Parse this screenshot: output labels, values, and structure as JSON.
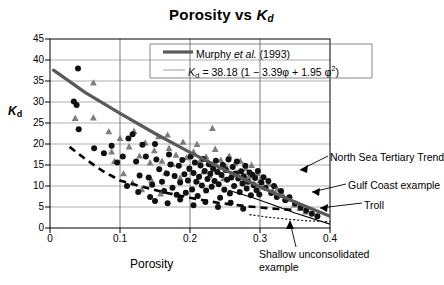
{
  "figure": {
    "title_main": "Porosity vs ",
    "title_var": "K",
    "title_var_sub": "d",
    "y_axis_label": "K",
    "y_axis_label_sub": "d",
    "x_axis_label": "Porosity"
  },
  "legend": {
    "entry_label_pre": "Murphy ",
    "entry_label_ital": "et al.",
    "entry_label_post": " (1993)",
    "equation_var": "K",
    "equation_var_sub": "d",
    "equation_body": " = 38.18 (1 − 3.39φ + 1.95 φ",
    "equation_exp": "2",
    "equation_close": ")",
    "line_color": "#595959"
  },
  "annotations": [
    {
      "name": "north-sea-tertiary-trend",
      "text": "North Sea Tertiary Trend"
    },
    {
      "name": "gulf-coast-example",
      "text": "Gulf Coast example"
    },
    {
      "name": "troll",
      "text": "Troll"
    },
    {
      "name": "shallow-unconsolidated-example-line1",
      "text": "Shallow unconsolidated"
    },
    {
      "name": "shallow-unconsolidated-example-line2",
      "text": "example"
    }
  ],
  "chart_data": {
    "type": "scatter",
    "title": "Porosity vs Kd",
    "xlabel": "Porosity",
    "ylabel": "Kd",
    "xlim": [
      0,
      0.4
    ],
    "ylim": [
      0,
      45
    ],
    "xticks": [
      "0",
      "0.1",
      "0.2",
      "0.3",
      "0.4"
    ],
    "xtick_values": [
      0,
      0.1,
      0.2,
      0.3,
      0.4
    ],
    "yticks": [
      "0",
      "5",
      "10",
      "15",
      "20",
      "25",
      "30",
      "35",
      "40",
      "45"
    ],
    "ytick_values": [
      0,
      5,
      10,
      15,
      20,
      25,
      30,
      35,
      40,
      45
    ],
    "grid": "both",
    "legend_position": "top-right-inside",
    "series": [
      {
        "name": "Murphy et al. (1993) fit",
        "type": "line",
        "style": "solid-thick",
        "color": "#595959",
        "equation": "Kd = 38.18 (1 - 3.39*phi + 1.95*phi^2)",
        "points": [
          [
            0.005,
            37.6
          ],
          [
            0.05,
            32.3
          ],
          [
            0.1,
            27.3
          ],
          [
            0.15,
            22.5
          ],
          [
            0.2,
            18.0
          ],
          [
            0.25,
            13.8
          ],
          [
            0.3,
            9.8
          ],
          [
            0.35,
            6.2
          ],
          [
            0.4,
            2.8
          ]
        ]
      },
      {
        "name": "North Sea Tertiary Trend",
        "type": "line",
        "style": "dashed",
        "color": "#000000",
        "points": [
          [
            0.028,
            19.3
          ],
          [
            0.05,
            16.5
          ],
          [
            0.075,
            13.6
          ],
          [
            0.1,
            11.3
          ],
          [
            0.13,
            9.9
          ],
          [
            0.16,
            8.6
          ],
          [
            0.2,
            7.2
          ],
          [
            0.24,
            6.0
          ],
          [
            0.28,
            5.2
          ],
          [
            0.32,
            4.6
          ],
          [
            0.345,
            4.3
          ]
        ]
      },
      {
        "name": "Shallow unconsolidated trend",
        "type": "line",
        "style": "dotted",
        "color": "#000000",
        "points": [
          [
            0.285,
            3.2
          ],
          [
            0.31,
            2.6
          ],
          [
            0.34,
            2.1
          ],
          [
            0.37,
            1.7
          ],
          [
            0.4,
            1.5
          ]
        ]
      },
      {
        "name": "Gulf Coast example (black circles)",
        "type": "scatter",
        "marker": "circle",
        "color": "#111111",
        "points": [
          [
            0.04,
            38.0
          ],
          [
            0.034,
            30.1
          ],
          [
            0.038,
            29.3
          ],
          [
            0.041,
            23.5
          ],
          [
            0.063,
            19.0
          ],
          [
            0.077,
            17.8
          ],
          [
            0.088,
            19.6
          ],
          [
            0.096,
            15.6
          ],
          [
            0.104,
            17.0
          ],
          [
            0.112,
            21.3
          ],
          [
            0.118,
            22.3
          ],
          [
            0.123,
            15.8
          ],
          [
            0.128,
            12.5
          ],
          [
            0.132,
            19.8
          ],
          [
            0.137,
            17.0
          ],
          [
            0.141,
            12.0
          ],
          [
            0.146,
            10.3
          ],
          [
            0.15,
            20.0
          ],
          [
            0.152,
            16.3
          ],
          [
            0.156,
            14.0
          ],
          [
            0.16,
            11.0
          ],
          [
            0.163,
            8.8
          ],
          [
            0.167,
            13.0
          ],
          [
            0.17,
            17.5
          ],
          [
            0.172,
            15.1
          ],
          [
            0.175,
            9.6
          ],
          [
            0.178,
            12.4
          ],
          [
            0.181,
            7.9
          ],
          [
            0.184,
            14.8
          ],
          [
            0.186,
            10.8
          ],
          [
            0.189,
            16.2
          ],
          [
            0.192,
            12.8
          ],
          [
            0.194,
            8.4
          ],
          [
            0.197,
            11.3
          ],
          [
            0.199,
            14.2
          ],
          [
            0.201,
            17.0
          ],
          [
            0.203,
            9.2
          ],
          [
            0.205,
            13.1
          ],
          [
            0.207,
            15.6
          ],
          [
            0.209,
            11.0
          ],
          [
            0.211,
            7.6
          ],
          [
            0.213,
            12.2
          ],
          [
            0.215,
            14.9
          ],
          [
            0.217,
            10.1
          ],
          [
            0.219,
            16.4
          ],
          [
            0.221,
            13.6
          ],
          [
            0.223,
            8.9
          ],
          [
            0.225,
            11.7
          ],
          [
            0.227,
            15.2
          ],
          [
            0.229,
            12.9
          ],
          [
            0.231,
            9.8
          ],
          [
            0.233,
            14.1
          ],
          [
            0.235,
            11.2
          ],
          [
            0.237,
            16.0
          ],
          [
            0.239,
            13.3
          ],
          [
            0.241,
            10.4
          ],
          [
            0.243,
            7.2
          ],
          [
            0.245,
            12.6
          ],
          [
            0.247,
            15.0
          ],
          [
            0.249,
            9.1
          ],
          [
            0.251,
            13.8
          ],
          [
            0.253,
            11.5
          ],
          [
            0.255,
            16.3
          ],
          [
            0.257,
            8.2
          ],
          [
            0.259,
            12.0
          ],
          [
            0.261,
            14.5
          ],
          [
            0.263,
            10.0
          ],
          [
            0.265,
            13.0
          ],
          [
            0.267,
            15.8
          ],
          [
            0.269,
            11.8
          ],
          [
            0.271,
            8.6
          ],
          [
            0.273,
            13.5
          ],
          [
            0.275,
            10.6
          ],
          [
            0.277,
            12.3
          ],
          [
            0.279,
            14.8
          ],
          [
            0.281,
            9.4
          ],
          [
            0.283,
            11.0
          ],
          [
            0.285,
            13.2
          ],
          [
            0.287,
            7.8
          ],
          [
            0.289,
            12.7
          ],
          [
            0.291,
            10.2
          ],
          [
            0.293,
            11.9
          ],
          [
            0.295,
            9.0
          ],
          [
            0.297,
            13.6
          ],
          [
            0.299,
            8.0
          ],
          [
            0.302,
            10.8
          ],
          [
            0.305,
            12.1
          ],
          [
            0.308,
            9.5
          ],
          [
            0.312,
            11.2
          ],
          [
            0.316,
            8.3
          ],
          [
            0.32,
            10.0
          ],
          [
            0.324,
            7.4
          ],
          [
            0.33,
            8.8
          ],
          [
            0.336,
            6.6
          ],
          [
            0.342,
            7.3
          ],
          [
            0.35,
            5.8
          ],
          [
            0.358,
            4.9
          ],
          [
            0.366,
            4.2
          ],
          [
            0.374,
            3.4
          ],
          [
            0.382,
            2.8
          ],
          [
            0.15,
            6.4
          ],
          [
            0.168,
            5.9
          ],
          [
            0.186,
            6.8
          ],
          [
            0.205,
            5.4
          ],
          [
            0.222,
            6.2
          ],
          [
            0.24,
            5.0
          ],
          [
            0.258,
            6.0
          ],
          [
            0.276,
            4.6
          ],
          [
            0.11,
            10.0
          ],
          [
            0.126,
            8.6
          ],
          [
            0.143,
            7.4
          ]
        ]
      },
      {
        "name": "North Sea samples (gray triangles)",
        "type": "scatter",
        "marker": "triangle",
        "color": "#7d7d7d",
        "points": [
          [
            0.062,
            34.6
          ],
          [
            0.036,
            26.2
          ],
          [
            0.062,
            26.3
          ],
          [
            0.084,
            23.0
          ],
          [
            0.1,
            21.4
          ],
          [
            0.113,
            19.4
          ],
          [
            0.12,
            23.1
          ],
          [
            0.128,
            17.2
          ],
          [
            0.136,
            20.3
          ],
          [
            0.143,
            15.6
          ],
          [
            0.149,
            18.5
          ],
          [
            0.155,
            21.8
          ],
          [
            0.16,
            16.0
          ],
          [
            0.165,
            13.2
          ],
          [
            0.17,
            19.0
          ],
          [
            0.175,
            15.2
          ],
          [
            0.18,
            17.4
          ],
          [
            0.186,
            12.0
          ],
          [
            0.19,
            20.5
          ],
          [
            0.195,
            16.8
          ],
          [
            0.2,
            14.0
          ],
          [
            0.205,
            18.2
          ],
          [
            0.21,
            11.3
          ],
          [
            0.214,
            15.9
          ],
          [
            0.219,
            13.4
          ],
          [
            0.223,
            17.0
          ],
          [
            0.228,
            12.6
          ],
          [
            0.232,
            15.1
          ],
          [
            0.236,
            18.8
          ],
          [
            0.24,
            13.9
          ],
          [
            0.244,
            16.2
          ],
          [
            0.248,
            11.8
          ],
          [
            0.252,
            14.6
          ],
          [
            0.256,
            17.2
          ],
          [
            0.26,
            12.9
          ],
          [
            0.264,
            15.4
          ],
          [
            0.268,
            13.1
          ],
          [
            0.272,
            16.0
          ],
          [
            0.276,
            11.0
          ],
          [
            0.28,
            14.2
          ],
          [
            0.284,
            12.2
          ],
          [
            0.288,
            15.0
          ],
          [
            0.292,
            10.5
          ],
          [
            0.296,
            13.0
          ],
          [
            0.3,
            11.4
          ],
          [
            0.306,
            9.8
          ],
          [
            0.312,
            10.6
          ],
          [
            0.318,
            8.9
          ],
          [
            0.325,
            9.3
          ],
          [
            0.333,
            7.8
          ],
          [
            0.341,
            6.9
          ],
          [
            0.349,
            5.6
          ],
          [
            0.357,
            4.7
          ],
          [
            0.365,
            3.9
          ],
          [
            0.232,
            23.8
          ],
          [
            0.21,
            20.0
          ],
          [
            0.168,
            22.2
          ],
          [
            0.092,
            15.9
          ],
          [
            0.105,
            13.0
          ],
          [
            0.118,
            10.8
          ],
          [
            0.131,
            9.2
          ],
          [
            0.145,
            11.4
          ],
          [
            0.158,
            8.2
          ],
          [
            0.088,
            18.2
          ]
        ]
      }
    ]
  }
}
